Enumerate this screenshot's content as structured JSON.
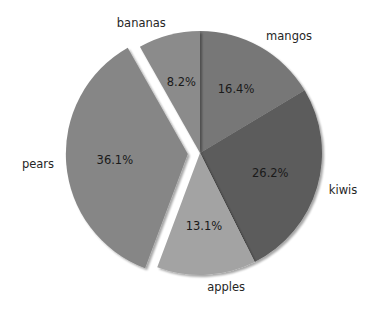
{
  "chart_data": {
    "type": "pie",
    "title": "",
    "categories": [
      "mangos",
      "kiwis",
      "apples",
      "pears",
      "bananas"
    ],
    "values": [
      16.4,
      26.2,
      13.1,
      36.1,
      8.2
    ],
    "percent_labels": [
      "16.4%",
      "26.2%",
      "13.1%",
      "36.1%",
      "8.2%"
    ],
    "colors": [
      "#777777",
      "#5b5b5b",
      "#a3a3a3",
      "#868686",
      "#8b8b8b"
    ],
    "explode": [
      0,
      0,
      0,
      0.1,
      0
    ],
    "exploded_slice": "pears",
    "shadow": true,
    "startangle": 90,
    "counterclock": false,
    "legend": null
  },
  "geometry": {
    "cx": 200,
    "cy": 153,
    "r": 122
  }
}
